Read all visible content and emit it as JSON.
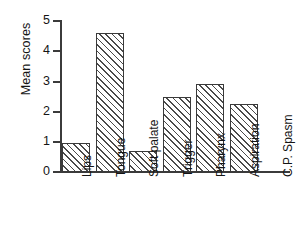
{
  "chart_data": {
    "type": "bar",
    "title": "",
    "xlabel": "",
    "ylabel": "Mean scores",
    "ylim": [
      0,
      5
    ],
    "yticks": [
      0,
      1,
      2,
      3,
      4,
      5
    ],
    "ytick_labels": [
      "0",
      "1",
      "2",
      "3",
      "4",
      "5"
    ],
    "grid": false,
    "legend": "none",
    "bar_style": "diagonal-hatch",
    "categories": [
      "Lips",
      "Tongue",
      "Soft palate",
      "Trigger",
      "Pharynx",
      "Aspiration",
      "C.P. Spasm"
    ],
    "values": [
      0.95,
      4.6,
      0.7,
      2.5,
      2.9,
      2.25,
      0
    ],
    "colors": {
      "axis": "#3b3b3b",
      "bar_edge": "#3a3a3a",
      "hatch": "#4a4a4a",
      "background": "#ffffff",
      "text": "#151515"
    }
  }
}
